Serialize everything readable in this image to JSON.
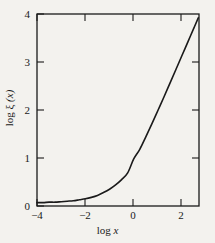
{
  "chart_data": {
    "type": "line",
    "title": "",
    "subtitle": "",
    "xlabel": "log x",
    "ylabel": "log ξ (x)",
    "xlim": [
      -4,
      2.7
    ],
    "ylim": [
      0,
      4
    ],
    "xticks": [
      -4,
      -2,
      0,
      2
    ],
    "xtick_labels": [
      "−4",
      "−2",
      "0",
      "2"
    ],
    "yticks": [
      0,
      1,
      2,
      3,
      4
    ],
    "ytick_labels": [
      "0",
      "1",
      "2",
      "3",
      "4"
    ],
    "grid": false,
    "legend": "none",
    "frame": "box",
    "tick_direction": "in",
    "series": [
      {
        "name": "log ξ (x)",
        "color": "#1a1a1a",
        "linewidth": 1.6,
        "x": [
          -4.0,
          -3.75,
          -3.5,
          -3.25,
          -3.0,
          -2.75,
          -2.5,
          -2.25,
          -2.0,
          -1.75,
          -1.5,
          -1.25,
          -1.0,
          -0.75,
          -0.5,
          -0.25,
          0.0,
          0.25,
          0.5,
          0.75,
          1.0,
          1.25,
          1.5,
          1.75,
          2.0,
          2.25,
          2.5,
          2.67
        ],
        "y": [
          0.07,
          0.07,
          0.08,
          0.08,
          0.09,
          0.1,
          0.11,
          0.13,
          0.15,
          0.18,
          0.22,
          0.28,
          0.35,
          0.44,
          0.55,
          0.69,
          0.98,
          1.18,
          1.44,
          1.71,
          1.99,
          2.27,
          2.56,
          2.85,
          3.14,
          3.43,
          3.72,
          3.92
        ]
      }
    ],
    "annotations": []
  },
  "axes": {
    "x_title": "log x",
    "x_title_prefix": "log ",
    "x_title_var": "x",
    "y_title": "log ξ (x)",
    "y_title_prefix": "log ",
    "y_title_greek": "ξ",
    "y_title_arg": "(x)"
  },
  "colors": {
    "background": "#f3f2ee",
    "axis": "#1a1a1a",
    "curve": "#1a1a1a",
    "text": "#1a1a1a"
  }
}
